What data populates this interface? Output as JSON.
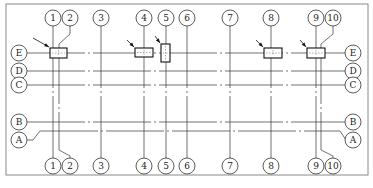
{
  "diagram": {
    "type": "structural-axis-grid-plan",
    "columns": [
      {
        "label": "1",
        "x": 53,
        "circle_x": 53
      },
      {
        "label": "2",
        "x": 59,
        "circle_x": 70,
        "leader": true
      },
      {
        "label": "3",
        "x": 101,
        "circle_x": 101
      },
      {
        "label": "4",
        "x": 144,
        "circle_x": 144
      },
      {
        "label": "5",
        "x": 166,
        "circle_x": 166
      },
      {
        "label": "6",
        "x": 187,
        "circle_x": 187
      },
      {
        "label": "7",
        "x": 230,
        "circle_x": 230
      },
      {
        "label": "8",
        "x": 271,
        "circle_x": 271
      },
      {
        "label": "9",
        "x": 316,
        "circle_x": 316
      },
      {
        "label": "10",
        "x": 321,
        "circle_x": 333,
        "leader": true
      }
    ],
    "rows": [
      {
        "label": "E",
        "y": 53,
        "circle_y": 53
      },
      {
        "label": "D",
        "y": 71,
        "circle_y": 71
      },
      {
        "label": "C",
        "y": 85,
        "circle_y": 85
      },
      {
        "label": "B",
        "y": 122,
        "circle_y": 122
      },
      {
        "label": "A",
        "y": 131,
        "circle_y": 140,
        "leader": true
      }
    ],
    "markers": [
      {
        "name": "marker-1",
        "x": 50,
        "y": 48,
        "w": 17,
        "h": 10,
        "arrow_from": [
          33,
          38
        ]
      },
      {
        "name": "marker-4",
        "x": 135,
        "y": 48,
        "w": 18,
        "h": 9,
        "arrow_from": [
          127,
          40
        ]
      },
      {
        "name": "marker-5",
        "x": 161,
        "y": 44,
        "w": 9,
        "h": 18,
        "arrow_from": [
          155,
          36
        ]
      },
      {
        "name": "marker-8",
        "x": 264,
        "y": 48,
        "w": 18,
        "h": 10,
        "arrow_from": [
          256,
          40
        ]
      },
      {
        "name": "marker-9",
        "x": 307,
        "y": 48,
        "w": 18,
        "h": 10,
        "arrow_from": [
          300,
          40
        ]
      }
    ],
    "colors": {
      "line": "#333333",
      "border": "#888888",
      "background": "#ffffff"
    }
  }
}
